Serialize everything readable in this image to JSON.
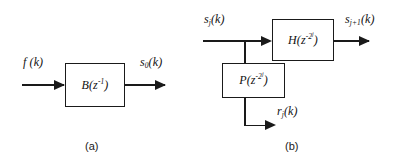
{
  "figure": {
    "ink_color": "#1a1a1a",
    "background": "#ffffff"
  },
  "panel_a": {
    "caption": "(a)",
    "input_label": "f (k)",
    "block_label_base": "B(z",
    "block_label_exp": "-1",
    "block_label_close": ")",
    "output_label_base": "s",
    "output_label_sub": "0",
    "output_label_rest": "(k)"
  },
  "panel_b": {
    "caption": "(b)",
    "input_label_base": "s",
    "input_label_sub": "j",
    "input_label_rest": "(k)",
    "top_block_label_base": "H(z",
    "top_block_label_exp": "-2",
    "top_block_label_exp_sup": "j",
    "top_block_label_close": ")",
    "bottom_block_label_base": "P(z",
    "bottom_block_label_exp": "-2",
    "bottom_block_label_exp_sup": "j",
    "bottom_block_label_close": ")",
    "output_top_base": "s",
    "output_top_sub": "j+1",
    "output_top_rest": "(k)",
    "output_bottom_base": "r",
    "output_bottom_sub": "j",
    "output_bottom_rest": "(k)"
  }
}
